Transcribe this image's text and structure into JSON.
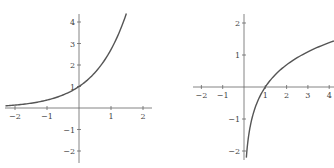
{
  "chart_data": [
    {
      "type": "line",
      "title": "",
      "function": "y = e^x",
      "xlabel": "",
      "ylabel": "",
      "xlim": [
        -2.3,
        2.3
      ],
      "ylim": [
        -2.3,
        4.4
      ],
      "x_ticks": [
        -2,
        -1,
        1,
        2
      ],
      "y_ticks": [
        -2,
        -1,
        1,
        2,
        3,
        4
      ],
      "x_tick_labels": [
        "−2",
        "−1",
        "1",
        "2"
      ],
      "y_tick_labels": [
        "−2",
        "−1",
        "1",
        "2",
        "3",
        "4"
      ],
      "grid": false,
      "legend": null,
      "series": [
        {
          "name": "exponential",
          "x": [
            -2.3,
            -2,
            -1.5,
            -1,
            -0.5,
            0,
            0.5,
            1,
            1.25,
            1.48
          ],
          "y": [
            0.1,
            0.14,
            0.22,
            0.37,
            0.61,
            1.0,
            1.65,
            2.72,
            3.49,
            4.39
          ]
        }
      ]
    },
    {
      "type": "line",
      "title": "",
      "function": "y = ln x",
      "xlabel": "",
      "ylabel": "",
      "xlim": [
        -2.6,
        4.2
      ],
      "ylim": [
        -2.3,
        2.3
      ],
      "x_ticks": [
        -2,
        -1,
        1,
        2,
        3,
        4
      ],
      "y_ticks": [
        -2,
        -1,
        1,
        2
      ],
      "x_tick_labels": [
        "−2",
        "−1",
        "1",
        "2",
        "3",
        "4"
      ],
      "y_tick_labels": [
        "−2",
        "−1",
        "1",
        "2"
      ],
      "grid": false,
      "legend": null,
      "series": [
        {
          "name": "logarithm",
          "x": [
            0.11,
            0.2,
            0.5,
            1,
            2,
            3,
            4,
            4.22
          ],
          "y": [
            -2.2,
            -1.61,
            -0.69,
            0,
            0.69,
            1.1,
            1.39,
            1.44
          ]
        }
      ]
    }
  ],
  "left_graph": {
    "x_labels": [
      "−2",
      "−1",
      "1",
      "2"
    ],
    "y_labels": [
      "4",
      "3",
      "2",
      "1",
      "−1",
      "−2"
    ]
  },
  "right_graph": {
    "x_labels": [
      "−2",
      "−1",
      "1",
      "2",
      "3",
      "4"
    ],
    "y_labels": [
      "2",
      "1",
      "−1",
      "−2"
    ]
  },
  "colors": {
    "curve": "#555555",
    "axis": "#666666",
    "text": "#444444"
  }
}
